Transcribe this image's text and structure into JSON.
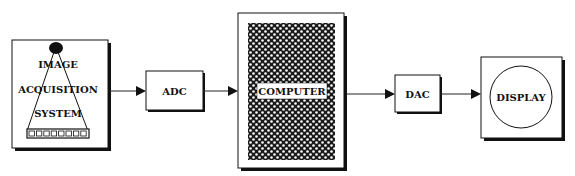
{
  "diagram": {
    "type": "block-diagram",
    "blocks": [
      {
        "id": "image-acquisition",
        "lines": [
          "IMAGE",
          "ACQUISITION",
          "SYSTEM"
        ]
      },
      {
        "id": "adc",
        "label": "ADC"
      },
      {
        "id": "computer",
        "label": "COMPUTER"
      },
      {
        "id": "dac",
        "label": "DAC"
      },
      {
        "id": "display",
        "label": "DISPLAY"
      }
    ],
    "connections": [
      {
        "from": "image-acquisition",
        "to": "adc"
      },
      {
        "from": "adc",
        "to": "computer"
      },
      {
        "from": "computer",
        "to": "dac"
      },
      {
        "from": "dac",
        "to": "display"
      }
    ],
    "colors": {
      "line": "#111111",
      "background": "#ffffff"
    }
  }
}
